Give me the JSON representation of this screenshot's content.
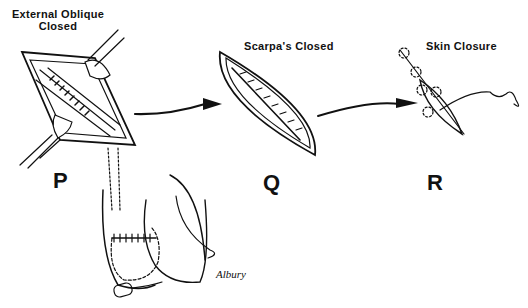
{
  "panels": [
    {
      "id": "P",
      "letter": "P",
      "title_line1": "External Oblique",
      "title_line2": "Closed"
    },
    {
      "id": "Q",
      "letter": "Q",
      "title_line1": "Scarpa's Closed"
    },
    {
      "id": "R",
      "letter": "R",
      "title_line1": "Skin Closure"
    }
  ],
  "signature": "Albury",
  "colors": {
    "ink": "#111111",
    "background": "#ffffff"
  }
}
